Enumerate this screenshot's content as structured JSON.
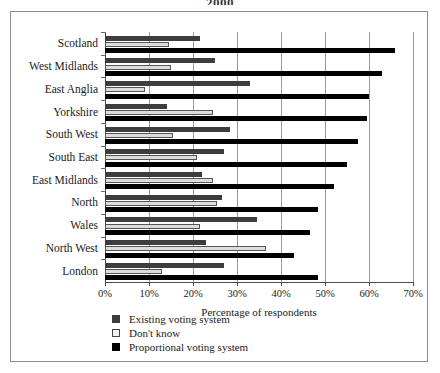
{
  "top_fragment": "2000",
  "chart_data": {
    "type": "bar",
    "orientation": "horizontal",
    "title": "",
    "xlabel": "Percentage of respondents",
    "ylabel": "",
    "xlim": [
      0,
      70
    ],
    "xticks": [
      "0%",
      "10%",
      "20%",
      "30%",
      "40%",
      "50%",
      "60%",
      "70%"
    ],
    "xtick_values": [
      0,
      10,
      20,
      30,
      40,
      50,
      60,
      70
    ],
    "grid": true,
    "legend_position": "below-left",
    "categories": [
      "Scotland",
      "West Midlands",
      "East Anglia",
      "Yorkshire",
      "South West",
      "South East",
      "East Midlands",
      "North",
      "Wales",
      "North West",
      "London"
    ],
    "series": [
      {
        "name": "Existing voting system",
        "color": "#3d3d3d",
        "values": [
          21.5,
          25.0,
          33.0,
          14.0,
          28.5,
          27.0,
          22.0,
          26.5,
          34.5,
          23.0,
          27.0
        ]
      },
      {
        "name": "Don't know",
        "color": "#dcdcdc",
        "values": [
          14.5,
          15.0,
          9.0,
          24.5,
          15.5,
          21.0,
          24.5,
          25.5,
          21.5,
          36.5,
          13.0
        ]
      },
      {
        "name": "Proportional voting system",
        "color": "#000000",
        "values": [
          66.0,
          63.0,
          60.0,
          59.5,
          57.5,
          55.0,
          52.0,
          48.5,
          46.5,
          43.0,
          48.5
        ]
      }
    ]
  }
}
